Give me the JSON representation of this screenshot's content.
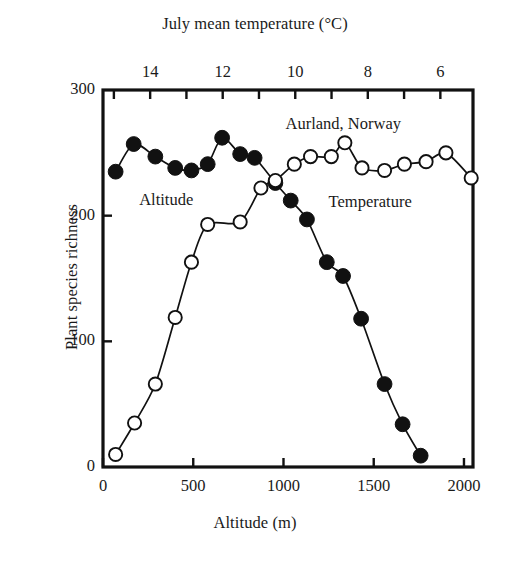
{
  "chart_data": {
    "type": "scatter",
    "title": "",
    "xlabel": "Altitude (m)",
    "ylabel": "Plant species richness",
    "xlabel_top": "July mean temperature (°C)",
    "xlim": [
      0,
      2050
    ],
    "ylim": [
      0,
      300
    ],
    "xlim_top": [
      15.3,
      5.1
    ],
    "xticks": [
      0,
      500,
      1000,
      1500,
      2000
    ],
    "xticklabels": [
      "0",
      "500",
      "1000",
      "1500",
      "2000"
    ],
    "yticks": [
      0,
      100,
      200,
      300
    ],
    "yticklabels": [
      "0",
      "100",
      "200",
      "300"
    ],
    "xticks_top": [
      6,
      8,
      10,
      12,
      14
    ],
    "xticklabels_top": [
      "6",
      "8",
      "10",
      "12",
      "14"
    ],
    "xticks_top_minor": [
      5,
      7,
      9,
      11,
      13,
      15
    ],
    "grid": false,
    "legend": "inline-annotations",
    "annotations": [
      {
        "text": "Aurland, Norway",
        "x": 1330,
        "y": 272
      },
      {
        "text": "Altitude",
        "x": 350,
        "y": 212
      },
      {
        "text": "Temperature",
        "x": 1480,
        "y": 210
      }
    ],
    "series": [
      {
        "name": "Altitude",
        "marker": "filled-circle",
        "color": "#111111",
        "points": [
          {
            "x": 70,
            "y": 235
          },
          {
            "x": 170,
            "y": 257
          },
          {
            "x": 290,
            "y": 247
          },
          {
            "x": 400,
            "y": 238
          },
          {
            "x": 490,
            "y": 236
          },
          {
            "x": 580,
            "y": 241
          },
          {
            "x": 660,
            "y": 262
          },
          {
            "x": 760,
            "y": 249
          },
          {
            "x": 840,
            "y": 246
          },
          {
            "x": 955,
            "y": 226
          },
          {
            "x": 1040,
            "y": 212
          },
          {
            "x": 1130,
            "y": 197
          },
          {
            "x": 1240,
            "y": 163
          },
          {
            "x": 1330,
            "y": 152
          },
          {
            "x": 1430,
            "y": 118
          },
          {
            "x": 1560,
            "y": 66
          },
          {
            "x": 1660,
            "y": 34
          },
          {
            "x": 1760,
            "y": 9
          }
        ]
      },
      {
        "name": "Temperature",
        "marker": "open-circle",
        "color": "#111111",
        "points": [
          {
            "x": 70,
            "y": 10
          },
          {
            "x": 175,
            "y": 35
          },
          {
            "x": 290,
            "y": 66
          },
          {
            "x": 400,
            "y": 119
          },
          {
            "x": 490,
            "y": 163
          },
          {
            "x": 580,
            "y": 193
          },
          {
            "x": 760,
            "y": 195
          },
          {
            "x": 875,
            "y": 222
          },
          {
            "x": 955,
            "y": 228
          },
          {
            "x": 1060,
            "y": 241
          },
          {
            "x": 1150,
            "y": 247
          },
          {
            "x": 1265,
            "y": 247
          },
          {
            "x": 1340,
            "y": 258
          },
          {
            "x": 1435,
            "y": 238
          },
          {
            "x": 1560,
            "y": 236
          },
          {
            "x": 1670,
            "y": 241
          },
          {
            "x": 1790,
            "y": 243
          },
          {
            "x": 1900,
            "y": 250
          },
          {
            "x": 2040,
            "y": 230
          }
        ]
      }
    ]
  },
  "axes": {
    "top_title": "July mean temperature (°C)",
    "bottom_title": "Altitude (m)",
    "left_title": "Plant species richness"
  }
}
